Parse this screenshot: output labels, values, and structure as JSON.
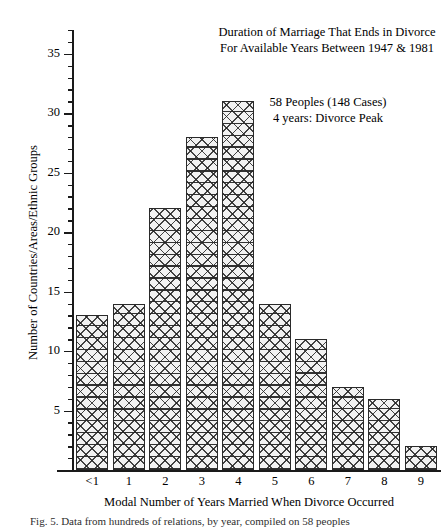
{
  "chart_data": {
    "type": "bar",
    "title": "Duration of Marriage That Ends in Divorce For Available Years Between 1947 & 1981",
    "title_line1": "Duration of Marriage That Ends in Divorce",
    "title_line2": "For Available Years Between 1947 & 1981",
    "annotation_line1": "58 Peoples (148 Cases)",
    "annotation_line2": "4 years: Divorce Peak",
    "xlabel": "Modal Number of Years Married When Divorce Occurred",
    "ylabel": "Number of Countries/Areas/Ethnic Groups",
    "categories": [
      "<1",
      "1",
      "2",
      "3",
      "4",
      "5",
      "6",
      "7",
      "8",
      "9"
    ],
    "values": [
      13,
      14,
      22,
      28,
      31,
      14,
      11,
      7,
      6,
      2
    ],
    "ylim": [
      0,
      37
    ],
    "xlim_note": "categorical",
    "ytick_major": [
      5,
      10,
      15,
      20,
      25,
      30,
      35
    ],
    "ytick_major_labels": [
      "5",
      "10",
      "15",
      "20",
      "25",
      "30",
      "35"
    ],
    "ytick_minor_step": 1,
    "grid": false,
    "legend": false,
    "bar_fill": "crosshatch",
    "bar_edge_color": "#2a2a2a",
    "bar_face_color": "#f2f2f2",
    "axis_color": "#1a1a1a",
    "peak_category": "4",
    "peak_value": 31
  },
  "caption": {
    "text": "Fig. 5. Data from hundreds of relations, by year, compiled on 58 peoples"
  }
}
